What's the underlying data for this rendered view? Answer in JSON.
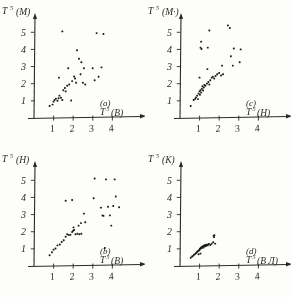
{
  "figure": {
    "background_color": "#fdfdfb",
    "ink_color": "#2b2b2b",
    "layout": "2x2 grid of scatter panels"
  },
  "chart_data": [
    {
      "type": "scatter",
      "panel_label": "(a)",
      "title": "",
      "ylabel": "T",
      "ylabel_sup": "5",
      "ylabel_paren": "(М)",
      "xlabel": "T",
      "xlabel_sup": "5",
      "xlabel_paren": "(В)",
      "xticks": [
        1,
        2,
        3,
        4
      ],
      "yticks": [
        1,
        2,
        3,
        4,
        5
      ],
      "xlim": [
        0,
        4.8
      ],
      "ylim": [
        0,
        5.6
      ],
      "grid": false,
      "legend": "none",
      "points": [
        [
          0.8,
          0.7
        ],
        [
          0.95,
          0.78
        ],
        [
          1.0,
          0.95
        ],
        [
          1.05,
          1.05
        ],
        [
          1.12,
          1.12
        ],
        [
          1.2,
          1.0
        ],
        [
          1.26,
          1.15
        ],
        [
          1.3,
          1.3
        ],
        [
          1.38,
          1.18
        ],
        [
          1.45,
          1.05
        ],
        [
          1.5,
          1.62
        ],
        [
          1.58,
          1.75
        ],
        [
          1.62,
          1.55
        ],
        [
          1.7,
          1.88
        ],
        [
          1.75,
          2.9
        ],
        [
          1.8,
          1.95
        ],
        [
          1.9,
          1.02
        ],
        [
          1.45,
          5.05
        ],
        [
          1.28,
          2.35
        ],
        [
          1.95,
          2.15
        ],
        [
          2.05,
          2.42
        ],
        [
          2.1,
          2.3
        ],
        [
          2.15,
          2.05
        ],
        [
          2.2,
          3.95
        ],
        [
          2.3,
          3.45
        ],
        [
          2.38,
          2.55
        ],
        [
          2.42,
          3.25
        ],
        [
          2.5,
          2.05
        ],
        [
          2.55,
          2.9
        ],
        [
          2.62,
          1.95
        ],
        [
          3.0,
          2.9
        ],
        [
          3.1,
          2.2
        ],
        [
          3.2,
          4.95
        ],
        [
          3.3,
          2.4
        ],
        [
          3.45,
          2.95
        ],
        [
          3.55,
          4.9
        ]
      ]
    },
    {
      "type": "scatter",
      "panel_label": "(c)",
      "title": "",
      "ylabel": "T",
      "ylabel_sup": "5",
      "ylabel_paren": "(М·)",
      "xlabel": "T",
      "xlabel_sup": "5",
      "xlabel_paren": "(Н)",
      "xticks": [
        1,
        2,
        3,
        4
      ],
      "yticks": [
        1,
        2,
        3,
        4,
        5
      ],
      "xlim": [
        0,
        4.8
      ],
      "ylim": [
        0,
        5.6
      ],
      "grid": false,
      "legend": "none",
      "points": [
        [
          0.55,
          0.7
        ],
        [
          0.7,
          1.05
        ],
        [
          0.78,
          1.12
        ],
        [
          0.82,
          1.2
        ],
        [
          0.88,
          1.3
        ],
        [
          0.92,
          1.1
        ],
        [
          0.95,
          1.42
        ],
        [
          1.0,
          1.55
        ],
        [
          1.02,
          1.35
        ],
        [
          1.05,
          1.62
        ],
        [
          1.08,
          1.48
        ],
        [
          1.12,
          1.7
        ],
        [
          1.15,
          1.85
        ],
        [
          1.18,
          1.6
        ],
        [
          1.22,
          1.78
        ],
        [
          1.25,
          1.92
        ],
        [
          1.0,
          2.35
        ],
        [
          1.05,
          4.1
        ],
        [
          1.08,
          4.45
        ],
        [
          1.1,
          4.02
        ],
        [
          1.3,
          1.88
        ],
        [
          1.38,
          2.0
        ],
        [
          1.45,
          2.1
        ],
        [
          1.5,
          1.95
        ],
        [
          1.42,
          4.1
        ],
        [
          1.5,
          5.1
        ],
        [
          1.55,
          2.2
        ],
        [
          1.62,
          2.35
        ],
        [
          1.4,
          2.85
        ],
        [
          1.68,
          2.4
        ],
        [
          1.75,
          2.3
        ],
        [
          1.82,
          2.45
        ],
        [
          1.9,
          2.55
        ],
        [
          2.0,
          2.62
        ],
        [
          2.1,
          2.48
        ],
        [
          2.2,
          2.55
        ],
        [
          2.15,
          3.05
        ],
        [
          2.45,
          5.4
        ],
        [
          2.55,
          5.25
        ],
        [
          2.6,
          3.6
        ],
        [
          2.7,
          3.05
        ],
        [
          2.75,
          4.05
        ],
        [
          3.05,
          3.25
        ],
        [
          3.1,
          4.0
        ]
      ]
    },
    {
      "type": "scatter",
      "panel_label": "(b)",
      "title": "",
      "ylabel": "T",
      "ylabel_sup": "5",
      "ylabel_paren": "(Н)",
      "xlabel": "T",
      "xlabel_sup": "5",
      "xlabel_paren": "(В)",
      "xticks": [
        1,
        2,
        3,
        4
      ],
      "yticks": [
        1,
        2,
        3,
        4,
        5
      ],
      "xlim": [
        0,
        4.8
      ],
      "ylim": [
        0,
        5.6
      ],
      "grid": false,
      "legend": "none",
      "points": [
        [
          0.8,
          0.62
        ],
        [
          0.92,
          0.8
        ],
        [
          1.0,
          0.95
        ],
        [
          1.1,
          1.02
        ],
        [
          1.2,
          1.2
        ],
        [
          1.32,
          1.25
        ],
        [
          1.42,
          1.4
        ],
        [
          1.52,
          1.5
        ],
        [
          1.62,
          1.7
        ],
        [
          1.7,
          1.85
        ],
        [
          1.78,
          1.8
        ],
        [
          1.86,
          1.82
        ],
        [
          1.95,
          1.98
        ],
        [
          2.0,
          2.05
        ],
        [
          2.05,
          2.1
        ],
        [
          2.02,
          2.25
        ],
        [
          2.12,
          1.85
        ],
        [
          2.22,
          1.88
        ],
        [
          2.32,
          1.85
        ],
        [
          2.42,
          1.88
        ],
        [
          2.28,
          2.35
        ],
        [
          2.4,
          2.5
        ],
        [
          2.55,
          3.05
        ],
        [
          1.62,
          3.8
        ],
        [
          1.95,
          3.85
        ],
        [
          2.62,
          2.55
        ],
        [
          3.05,
          3.95
        ],
        [
          3.1,
          5.1
        ],
        [
          3.42,
          3.4
        ],
        [
          3.5,
          2.95
        ],
        [
          3.55,
          2.92
        ],
        [
          3.62,
          1.05
        ],
        [
          3.68,
          5.05
        ],
        [
          3.78,
          3.45
        ],
        [
          3.88,
          2.95
        ],
        [
          3.95,
          2.35
        ],
        [
          4.05,
          3.5
        ],
        [
          4.12,
          5.05
        ],
        [
          4.18,
          4.05
        ],
        [
          4.35,
          3.42
        ]
      ]
    },
    {
      "type": "scatter",
      "panel_label": "(d)",
      "title": "",
      "ylabel": "T",
      "ylabel_sup": "5",
      "ylabel_paren": "(К)",
      "xlabel": "T",
      "xlabel_sup": "5",
      "xlabel_paren": "(В Л)",
      "xticks": [
        1,
        2,
        3,
        4
      ],
      "yticks": [
        1,
        2,
        3,
        4,
        5
      ],
      "xlim": [
        0,
        4.8
      ],
      "ylim": [
        0,
        5.6
      ],
      "grid": false,
      "legend": "none",
      "points": [
        [
          0.55,
          0.48
        ],
        [
          0.62,
          0.55
        ],
        [
          0.68,
          0.6
        ],
        [
          0.72,
          0.66
        ],
        [
          0.78,
          0.7
        ],
        [
          0.82,
          0.75
        ],
        [
          0.86,
          0.8
        ],
        [
          0.9,
          0.85
        ],
        [
          0.94,
          0.88
        ],
        [
          0.98,
          0.92
        ],
        [
          1.0,
          0.95
        ],
        [
          1.02,
          1.0
        ],
        [
          1.05,
          1.02
        ],
        [
          1.08,
          1.06
        ],
        [
          1.1,
          1.1
        ],
        [
          1.12,
          1.05
        ],
        [
          1.15,
          1.12
        ],
        [
          1.18,
          1.15
        ],
        [
          1.2,
          1.08
        ],
        [
          1.22,
          1.18
        ],
        [
          1.25,
          1.2
        ],
        [
          1.28,
          1.14
        ],
        [
          1.3,
          1.22
        ],
        [
          1.34,
          1.18
        ],
        [
          1.38,
          1.25
        ],
        [
          1.42,
          1.2
        ],
        [
          1.48,
          1.28
        ],
        [
          1.55,
          1.22
        ],
        [
          1.62,
          1.3
        ],
        [
          1.72,
          1.75
        ],
        [
          1.74,
          1.68
        ],
        [
          1.76,
          1.8
        ],
        [
          1.7,
          1.38
        ],
        [
          1.8,
          1.3
        ],
        [
          1.05,
          0.72
        ],
        [
          0.95,
          0.68
        ]
      ]
    }
  ]
}
